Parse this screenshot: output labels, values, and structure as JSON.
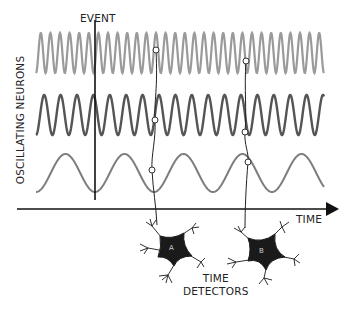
{
  "diagram": {
    "labels": {
      "event": "EVENT",
      "time_axis": "TIME",
      "y_axis": "OSCILLATING NEURONS",
      "detectors_line1": "TIME",
      "detectors_line2": "DETECTORS"
    },
    "oscillators": [
      {
        "name": "fast",
        "period_px": 9.6,
        "amp_px": 20,
        "center_y": 53,
        "color": "#9a9a9a"
      },
      {
        "name": "medium",
        "period_px": 16.4,
        "amp_px": 20,
        "center_y": 115,
        "color": "#555555"
      },
      {
        "name": "slow",
        "period_px": 59,
        "amp_px": 19,
        "center_y": 173,
        "color": "#7d7d7d"
      }
    ],
    "detectors": [
      {
        "label": "A",
        "taps": [
          [
            156,
            50
          ],
          [
            155,
            120
          ],
          [
            152,
            170
          ]
        ],
        "soma": [
          172,
          247
        ]
      },
      {
        "label": "B",
        "taps": [
          [
            246,
            61
          ],
          [
            245,
            132
          ],
          [
            248,
            162
          ]
        ],
        "soma": [
          262,
          250
        ]
      }
    ],
    "colors": {
      "axis": "#111111",
      "neuron": "#1a1a1a",
      "background": "#ffffff"
    }
  }
}
